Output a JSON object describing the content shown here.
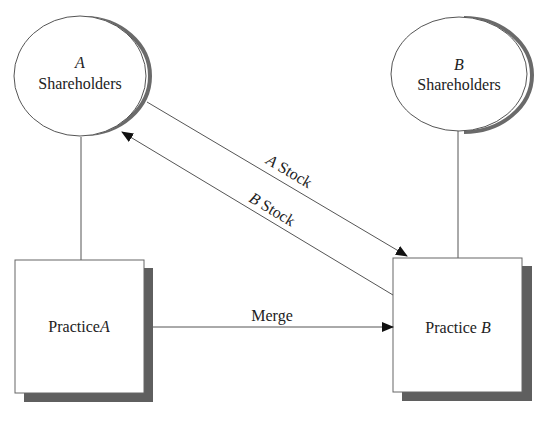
{
  "diagram": {
    "nodes": {
      "shareholders_a": {
        "letter": "A",
        "label": "Shareholders"
      },
      "shareholders_b": {
        "letter": "B",
        "label": "Shareholders"
      },
      "practice_a": {
        "label": "Practice",
        "letter": "A"
      },
      "practice_b": {
        "label": "Practice",
        "letter": "B"
      }
    },
    "edges": {
      "a_stock": {
        "letter": "A",
        "label": "Stock",
        "from": "shareholders_a",
        "to": "practice_b"
      },
      "b_stock": {
        "letter": "B",
        "label": "Stock",
        "from": "practice_b",
        "to": "shareholders_a"
      },
      "merge": {
        "label": "Merge",
        "from": "practice_a",
        "to": "practice_b"
      }
    },
    "colors": {
      "line": "#555555",
      "shadow": "#5f5f5f",
      "text": "#222222",
      "fill": "#ffffff"
    }
  }
}
